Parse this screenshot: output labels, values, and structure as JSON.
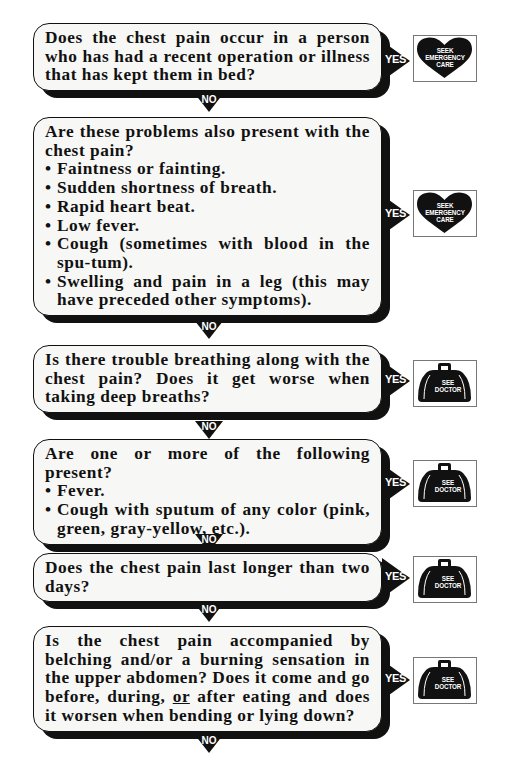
{
  "flowchart": {
    "yes_label": "YES",
    "no_label": "NO",
    "outcomes": {
      "emergency": {
        "icon": "heart-icon",
        "line1": "SEEK",
        "line2": "EMERGENCY",
        "line3": "CARE"
      },
      "doctor": {
        "icon": "doctor-bag-icon",
        "line1": "SEE",
        "line2": "DOCTOR"
      }
    },
    "nodes": [
      {
        "question": "Does the chest pain occur in a person who has had a recent operation or illness that has kept them in bed?",
        "yes_outcome": "SEEK EMERGENCY CARE"
      },
      {
        "question": "Are these problems also present with the chest pain?",
        "bullets": [
          "Faintness or fainting.",
          "Sudden shortness of breath.",
          "Rapid heart beat.",
          "Low fever.",
          "Cough (sometimes with blood in the spu-tum).",
          "Swelling and pain in a leg (this may have preceded other symptoms)."
        ],
        "yes_outcome": "SEEK EMERGENCY CARE"
      },
      {
        "question": "Is there trouble breathing along with the chest pain? Does it get worse when taking deep breaths?",
        "yes_outcome": "SEE DOCTOR"
      },
      {
        "question": "Are one or more of the following present?",
        "bullets": [
          "Fever.",
          "Cough with sputum of any color (pink, green, gray-yellow, etc.)."
        ],
        "yes_outcome": "SEE DOCTOR"
      },
      {
        "question": "Does the chest pain last longer than two days?",
        "yes_outcome": "SEE DOCTOR"
      },
      {
        "question_part1": "Is the chest pain accompanied by belching and/or a burning sensation in the upper abdomen? Does it come and go before, during, ",
        "question_underlined": "or",
        "question_part2": " after eating and does it worsen when bending or lying down?",
        "yes_outcome": "SEE DOCTOR"
      }
    ]
  }
}
